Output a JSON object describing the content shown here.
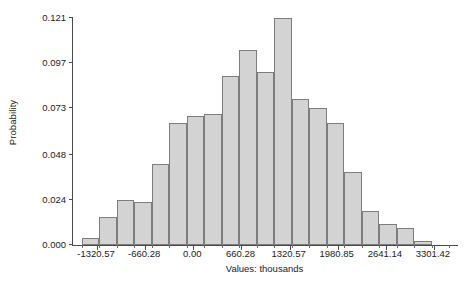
{
  "chart_data": {
    "type": "bar",
    "title": "",
    "subtitle": "",
    "xlabel": "Values: thousands",
    "ylabel": "Probability",
    "grid": false,
    "legend": null,
    "xlim": [
      -1650.71,
      3631.57
    ],
    "ylim": [
      0.0,
      0.121
    ],
    "y_ticks": [
      0.0,
      0.024,
      0.048,
      0.073,
      0.097,
      0.121
    ],
    "y_tick_labels": [
      "0.000",
      "0.024",
      "0.048",
      "0.073",
      "0.097",
      "0.121"
    ],
    "x_ticks": [
      -1320.57,
      -660.28,
      0.0,
      660.28,
      1320.57,
      1980.85,
      2641.14,
      3301.42
    ],
    "x_tick_labels": [
      "-1320.57",
      "-660.28",
      "0.00",
      "660.28",
      "1320.57",
      "1980.85",
      "2641.14",
      "3301.42"
    ],
    "bin_width": 240.1,
    "bar_fill_color": "#d3d3d3",
    "bar_edge_color": "#7d7d7d",
    "axis_color": "#4a4a4a",
    "categories": [
      "-1410.6",
      "-1170.5",
      "-930.4",
      "-690.3",
      "-450.2",
      "-210.1",
      "30.0",
      "270.1",
      "510.2",
      "750.3",
      "990.4",
      "1230.5",
      "1470.6",
      "1710.7",
      "1950.8",
      "2190.9",
      "2431.0",
      "2671.1",
      "2911.2",
      "3151.3",
      "3391.4",
      "3631.5"
    ],
    "values": [
      0.004,
      0.015,
      0.024,
      0.023,
      0.043,
      0.065,
      0.069,
      0.07,
      0.09,
      0.104,
      0.092,
      0.121,
      0.078,
      0.073,
      0.065,
      0.039,
      0.018,
      0.011,
      0.009,
      0.002,
      0.0,
      0.0
    ]
  },
  "axes": {
    "y_title": "Probability",
    "x_title": "Values: thousands"
  }
}
